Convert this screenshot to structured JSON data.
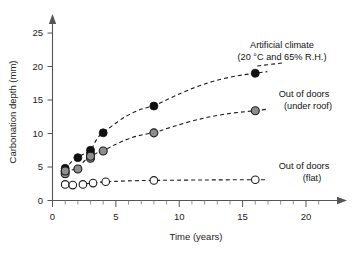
{
  "chart_data": {
    "type": "scatter",
    "title": "",
    "xlabel": "Time (years)",
    "ylabel": "Carbonation depth (mm)",
    "xlim": [
      0,
      21.5
    ],
    "ylim": [
      0,
      26.5
    ],
    "xticks": [
      0,
      5,
      10,
      15,
      20
    ],
    "yticks": [
      0,
      5,
      10,
      15,
      20,
      25
    ],
    "xtick_labels": [
      "0",
      "5",
      "10",
      "15",
      "20"
    ],
    "ytick_labels": [
      "0",
      "5",
      "10",
      "15",
      "20",
      "25"
    ],
    "x_minor_tick_step": 1,
    "grid": false,
    "legend_position": "inline-annotations",
    "series": [
      {
        "name": "Artificial climate (20 °C and 65% R.H.)",
        "label_line1": "Artificial climate",
        "label_line2": "(20 °C and 65% R.H.)",
        "marker": "filled-circle",
        "color": "#111111",
        "points": [
          {
            "x": 1,
            "y": 4.3
          },
          {
            "x": 1,
            "y": 4.8
          },
          {
            "x": 2,
            "y": 6.4
          },
          {
            "x": 3,
            "y": 7.0
          },
          {
            "x": 3,
            "y": 7.5
          },
          {
            "x": 4,
            "y": 10.1
          },
          {
            "x": 8,
            "y": 14.1
          },
          {
            "x": 16,
            "y": 19.0
          }
        ]
      },
      {
        "name": "Out of doors (under roof)",
        "label_line1": "Out of doors",
        "label_line2": "(under roof)",
        "marker": "gray-circle",
        "color": "#8d8d8d",
        "points": [
          {
            "x": 1,
            "y": 4.0
          },
          {
            "x": 1,
            "y": 4.4
          },
          {
            "x": 2,
            "y": 4.7
          },
          {
            "x": 3,
            "y": 6.3
          },
          {
            "x": 3,
            "y": 6.6
          },
          {
            "x": 4,
            "y": 7.4
          },
          {
            "x": 8,
            "y": 10.1
          },
          {
            "x": 16,
            "y": 13.4
          }
        ]
      },
      {
        "name": "Out of doors (flat)",
        "label_line1": "Out of doors",
        "label_line2": "(flat)",
        "marker": "open-circle",
        "color": "#ffffff",
        "points": [
          {
            "x": 1,
            "y": 2.4
          },
          {
            "x": 1.6,
            "y": 2.3
          },
          {
            "x": 2.4,
            "y": 2.4
          },
          {
            "x": 3.2,
            "y": 2.6
          },
          {
            "x": 4.2,
            "y": 2.8
          },
          {
            "x": 8,
            "y": 3.0
          },
          {
            "x": 16,
            "y": 3.1
          }
        ]
      }
    ]
  }
}
